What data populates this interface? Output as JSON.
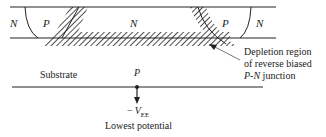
{
  "diagram": {
    "type": "semiconductor-cross-section",
    "regions": {
      "left_n_label": "N",
      "left_p_label": "P",
      "center_n_label": "N",
      "right_p_label": "P",
      "right_n_label": "N",
      "substrate_label": "Substrate",
      "substrate_type_label": "P"
    },
    "annotation": {
      "line1": "Depletion region",
      "line2": "of reverse biased",
      "line3_italic": "P-N",
      "line3_rest": " junction"
    },
    "bias": {
      "minus_sign": "−",
      "symbol": "V",
      "subscript": "EE",
      "description": "Lowest potential"
    },
    "colors": {
      "ink": "#222222",
      "background": "#ffffff"
    }
  }
}
